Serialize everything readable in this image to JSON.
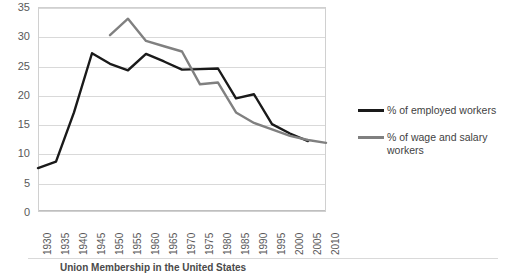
{
  "chart_data": {
    "type": "line",
    "title": "",
    "xlabel": "",
    "ylabel": "",
    "categories": [
      "1930",
      "1935",
      "1940",
      "1945",
      "1950",
      "1955",
      "1960",
      "1965",
      "1970",
      "1975",
      "1980",
      "1985",
      "1990",
      "1995",
      "2000",
      "2005",
      "2010"
    ],
    "ylim": [
      0,
      35
    ],
    "xlim": [
      1930,
      2010
    ],
    "yticks": [
      0,
      5,
      10,
      15,
      20,
      25,
      30,
      35
    ],
    "grid": true,
    "legend_position": "right",
    "series": [
      {
        "name": "% of employed workers",
        "color": "#1a1a1a",
        "x": [
          1930,
          1935,
          1940,
          1945,
          1950,
          1955,
          1960,
          1965,
          1970,
          1975,
          1980,
          1985,
          1990,
          1995,
          2000,
          2005
        ],
        "values": [
          7.5,
          8.6,
          17.0,
          27.1,
          25.3,
          24.2,
          27.0,
          25.7,
          24.3,
          24.4,
          24.5,
          19.4,
          20.1,
          15.0,
          13.4,
          12.1
        ]
      },
      {
        "name": "% of wage and salary workers",
        "color": "#808080",
        "x": [
          1950,
          1955,
          1960,
          1965,
          1970,
          1975,
          1980,
          1985,
          1990,
          1995,
          2000,
          2005,
          2010
        ],
        "values": [
          30.2,
          33.0,
          29.2,
          28.3,
          27.4,
          21.8,
          22.1,
          17.0,
          15.2,
          14.1,
          13.0,
          12.3,
          11.8
        ]
      }
    ]
  },
  "legend": {
    "entries": [
      {
        "label": "% of employed workers",
        "color": "#1a1a1a"
      },
      {
        "label": "% of wage and salary workers",
        "color": "#808080"
      }
    ]
  },
  "caption": {
    "text": "Union Membership in the United States"
  }
}
